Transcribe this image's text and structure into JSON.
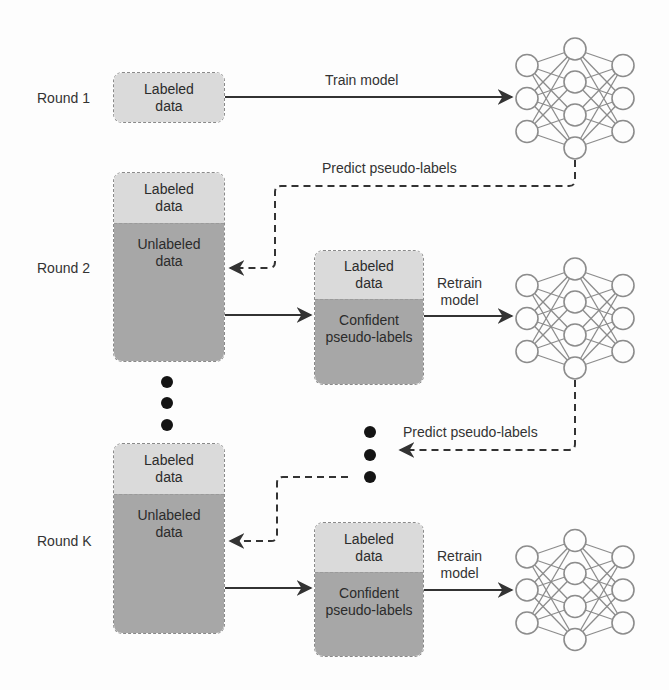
{
  "diagram": {
    "colors": {
      "labeled": "#dadada",
      "unlabeled": "#a7a7a7",
      "edge": "#333333",
      "nn_stroke": "#8c8c8c",
      "dot": "#141414"
    },
    "rounds": [
      {
        "label": "Round 1",
        "data_box": {
          "labeled": "Labeled\ndata"
        },
        "edge_to_model": "Train model"
      },
      {
        "label": "Round 2",
        "data_box": {
          "labeled": "Labeled\ndata",
          "unlabeled": "Unlabeled\ndata"
        },
        "feedback_edge": "Predict pseudo-labels",
        "selected_box": {
          "labeled": "Labeled\ndata",
          "pseudo": "Confident\npseudo-labels"
        },
        "edge_to_model": "Retrain\nmodel"
      },
      {
        "label": "Round K",
        "data_box": {
          "labeled": "Labeled\ndata",
          "unlabeled": "Unlabeled\ndata"
        },
        "feedback_edge": "Predict pseudo-labels",
        "selected_box": {
          "labeled": "Labeled\ndata",
          "pseudo": "Confident\npseudo-labels"
        },
        "edge_to_model": "Retrain\nmodel"
      }
    ],
    "neural_network": {
      "layers": [
        3,
        4,
        3
      ]
    },
    "ellipsis": "..."
  }
}
